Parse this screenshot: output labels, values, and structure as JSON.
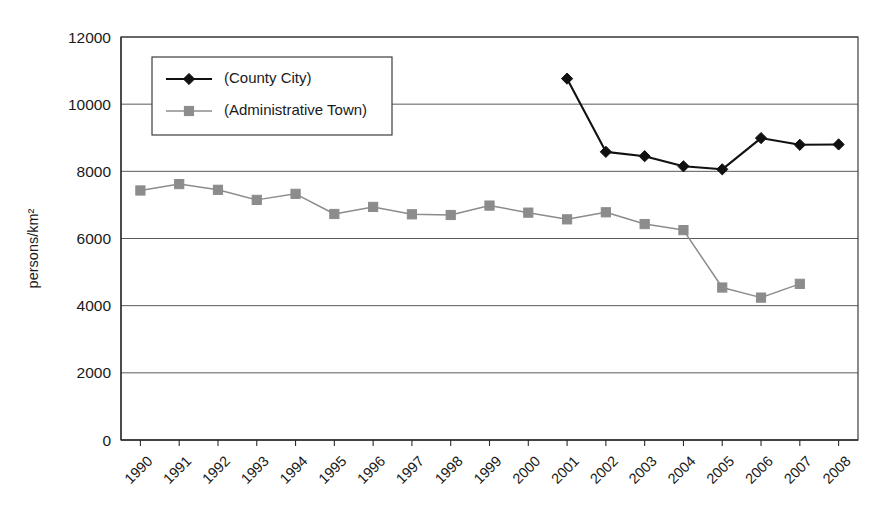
{
  "chart_data": {
    "type": "line",
    "title": "",
    "xlabel": "",
    "ylabel": "persons/km2",
    "ylabel_display": "persons/km²",
    "ylim": [
      0,
      12000
    ],
    "ytick_step": 2000,
    "yticks": [
      "0",
      "2000",
      "4000",
      "6000",
      "8000",
      "10000",
      "12000"
    ],
    "grid": "horizontal",
    "legend_position": "top-left-inside",
    "categories": [
      "1990",
      "1991",
      "1992",
      "1993",
      "1994",
      "1995",
      "1996",
      "1997",
      "1998",
      "1999",
      "2000",
      "2001",
      "2002",
      "2003",
      "2004",
      "2005",
      "2006",
      "2007",
      "2008"
    ],
    "series": [
      {
        "name": "(County City)",
        "color": "#111111",
        "marker": "diamond",
        "values": [
          null,
          null,
          null,
          null,
          null,
          null,
          null,
          null,
          null,
          null,
          null,
          10760,
          8580,
          8450,
          8150,
          8060,
          8990,
          8790,
          8800
        ]
      },
      {
        "name": "(Administrative Town)",
        "color": "#8c8c8c",
        "marker": "square",
        "values": [
          7430,
          7620,
          7450,
          7150,
          7330,
          6730,
          6940,
          6720,
          6700,
          6980,
          6770,
          6570,
          6780,
          6430,
          6250,
          4540,
          4240,
          4650,
          null
        ]
      }
    ]
  },
  "legend": {
    "items": [
      {
        "label": "(County City)",
        "color": "#111111",
        "marker": "diamond"
      },
      {
        "label": "(Administrative Town)",
        "color": "#8c8c8c",
        "marker": "square"
      }
    ]
  }
}
